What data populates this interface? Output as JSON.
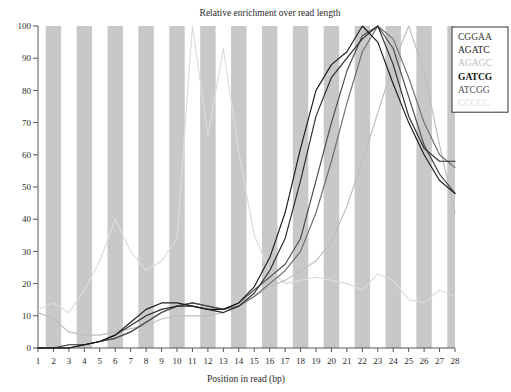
{
  "chart_data": {
    "type": "line",
    "title": "Relative enrichment over read length",
    "xlabel": "Position in read (bp)",
    "ylabel": "",
    "xlim": [
      1,
      28
    ],
    "ylim": [
      0,
      100
    ],
    "x": [
      1,
      2,
      3,
      4,
      5,
      6,
      7,
      8,
      9,
      10,
      11,
      12,
      13,
      14,
      15,
      16,
      17,
      18,
      19,
      20,
      21,
      22,
      23,
      24,
      25,
      26,
      27,
      28
    ],
    "xticks": [
      "1",
      "2",
      "3",
      "4",
      "5",
      "6",
      "7",
      "8",
      "9",
      "10",
      "11",
      "12",
      "13",
      "14",
      "15",
      "16",
      "17",
      "18",
      "19",
      "20",
      "21",
      "22",
      "23",
      "24",
      "25",
      "26",
      "27",
      "28"
    ],
    "yticks": [
      "0",
      "10",
      "20",
      "30",
      "40",
      "50",
      "60",
      "70",
      "80",
      "90",
      "100"
    ],
    "grid": false,
    "banded_background": true,
    "legend_position": "top-right",
    "series": [
      {
        "name": "CGGAA",
        "color": "#4a4a4a",
        "values": [
          0,
          0,
          0,
          1,
          2,
          3,
          5,
          8,
          11,
          13,
          14,
          13,
          12,
          14,
          18,
          22,
          26,
          34,
          52,
          70,
          86,
          97,
          100,
          93,
          78,
          63,
          54,
          48
        ]
      },
      {
        "name": "AGATC",
        "color": "#2b2b2b",
        "values": [
          0,
          0,
          1,
          1,
          2,
          4,
          7,
          10,
          12,
          13,
          13,
          12,
          11,
          13,
          17,
          24,
          34,
          52,
          72,
          84,
          90,
          96,
          100,
          88,
          72,
          62,
          58,
          58
        ]
      },
      {
        "name": "AGAGC",
        "color": "#bdbdbd",
        "values": [
          11,
          9,
          5,
          4,
          4,
          5,
          6,
          7,
          9,
          10,
          10,
          10,
          11,
          13,
          16,
          19,
          21,
          24,
          27,
          33,
          44,
          58,
          73,
          88,
          100,
          86,
          63,
          42
        ]
      },
      {
        "name": "GATCG",
        "color": "#1a1a1a",
        "values": [
          0,
          0,
          0,
          1,
          2,
          4,
          8,
          12,
          14,
          14,
          13,
          12,
          12,
          14,
          19,
          28,
          42,
          62,
          80,
          88,
          92,
          100,
          95,
          82,
          70,
          60,
          52,
          48
        ]
      },
      {
        "name": "ATCGG",
        "color": "#6e6e6e",
        "values": [
          0,
          0,
          0,
          1,
          2,
          3,
          5,
          8,
          11,
          13,
          14,
          13,
          12,
          13,
          16,
          20,
          24,
          30,
          42,
          58,
          76,
          92,
          100,
          96,
          84,
          70,
          60,
          56
        ]
      },
      {
        "name": "CCCCC",
        "color": "#dcdcdc",
        "values": [
          12,
          14,
          11,
          18,
          27,
          40,
          30,
          24,
          27,
          34,
          100,
          66,
          93,
          61,
          35,
          24,
          20,
          21,
          22,
          21,
          20,
          18,
          23,
          21,
          15,
          14,
          18,
          16
        ]
      }
    ]
  },
  "legend": {
    "entries": [
      {
        "label": "CGGAA",
        "color": "#333333",
        "weight": "normal"
      },
      {
        "label": "AGATC",
        "color": "#222222",
        "weight": "normal"
      },
      {
        "label": "AGAGC",
        "color": "#bcbcbc",
        "weight": "normal"
      },
      {
        "label": "GATCG",
        "color": "#111111",
        "weight": "bold"
      },
      {
        "label": "ATCGG",
        "color": "#4f4f4f",
        "weight": "normal"
      },
      {
        "label": "CCCCC",
        "color": "#e0e0e0",
        "weight": "normal"
      }
    ]
  }
}
